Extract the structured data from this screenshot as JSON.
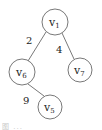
{
  "diagram": {
    "type": "tree",
    "nodes": [
      {
        "id": "v1",
        "label": "v",
        "sub": "1",
        "cx": 55,
        "cy": 22,
        "r": 13
      },
      {
        "id": "v6",
        "label": "v",
        "sub": "6",
        "cx": 22,
        "cy": 72,
        "r": 13
      },
      {
        "id": "v7",
        "label": "v",
        "sub": "7",
        "cx": 80,
        "cy": 70,
        "r": 12
      },
      {
        "id": "v5",
        "label": "v",
        "sub": "5",
        "cx": 50,
        "cy": 107,
        "r": 12
      }
    ],
    "edges": [
      {
        "from": "v1",
        "to": "v6",
        "weight": "2"
      },
      {
        "from": "v1",
        "to": "v7",
        "weight": "4"
      },
      {
        "from": "v6",
        "to": "v5",
        "weight": "9"
      }
    ],
    "caption": "图 ... "
  },
  "colors": {
    "stroke": "#555555",
    "text": "#222222"
  }
}
